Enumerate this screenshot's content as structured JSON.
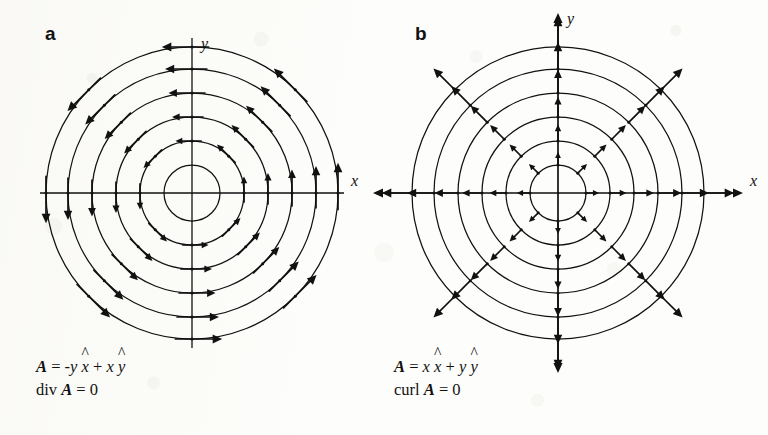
{
  "figure": {
    "background_color": "#fdfdfb",
    "ink_color": "#111111",
    "title": ""
  },
  "panels": [
    {
      "id": "a",
      "label": "a",
      "axis_x_label": "x",
      "axis_y_label": "y",
      "caption_line1_prefix": "A",
      "caption_line1": "A = -y x̂ + x ŷ",
      "caption_line2": "div A = 0",
      "caption_parts": {
        "vector_symbol": "A",
        "equals": "=",
        "term1_sign": "-",
        "term1_scalar": "y",
        "term1_unit": "x",
        "plus": "+",
        "term2_scalar": "x",
        "term2_unit": "y",
        "operator": "div",
        "operator_value": "0"
      },
      "field_type": "circulation",
      "center": {
        "x": 192,
        "y": 193
      },
      "circle_radii": [
        28,
        52,
        76,
        100,
        124,
        146
      ],
      "arrow_radii": [
        52,
        76,
        100,
        124,
        146
      ],
      "arrow_angles_deg": [
        0,
        45,
        90,
        135,
        180,
        225,
        270,
        315
      ],
      "axis_half_length_x": 152,
      "axis_half_length_y": 155,
      "axis_arrowheads": false
    },
    {
      "id": "b",
      "label": "b",
      "axis_x_label": "x",
      "axis_y_label": "y",
      "caption_line1": "A = x x̂ + y ŷ",
      "caption_line2": "curl A = 0",
      "caption_parts": {
        "vector_symbol": "A",
        "equals": "=",
        "term1_sign": "",
        "term1_scalar": "x",
        "term1_unit": "x",
        "plus": "+",
        "term2_scalar": "y",
        "term2_unit": "y",
        "operator": "curl",
        "operator_value": "0"
      },
      "field_type": "radial",
      "center": {
        "x": 174,
        "y": 193
      },
      "circle_radii": [
        28,
        52,
        76,
        100,
        124,
        146
      ],
      "arrow_radii": [
        28,
        52,
        76,
        100,
        124,
        146
      ],
      "arrow_angles_deg": [
        0,
        45,
        90,
        135,
        180,
        225,
        270,
        315
      ],
      "axis_half_length_x": 185,
      "axis_half_length_y": 180,
      "axis_arrowheads": true
    }
  ],
  "chart_data": {
    "type": "scatter",
    "xlabel": "x",
    "ylabel": "y",
    "grid": false,
    "legend": "none",
    "panels": [
      {
        "label": "a",
        "description": "Concentric circular field lines with counter-clockwise tangential arrows",
        "formula": "A = -y x̂ + x ŷ",
        "property": "div A = 0",
        "contour_radii": [
          1,
          2,
          3,
          4,
          5,
          6
        ],
        "arrow_direction": "counter-clockwise tangential",
        "arrow_angles_deg": [
          0,
          45,
          90,
          135,
          180,
          225,
          270,
          315
        ],
        "arrow_magnitude_rule": "proportional to radius"
      },
      {
        "label": "b",
        "description": "Concentric circles with outward radial arrows",
        "formula": "A = x x̂ + y ŷ",
        "property": "curl A = 0",
        "contour_radii": [
          1,
          2,
          3,
          4,
          5,
          6
        ],
        "arrow_direction": "outward radial",
        "arrow_angles_deg": [
          0,
          45,
          90,
          135,
          180,
          225,
          270,
          315
        ],
        "arrow_magnitude_rule": "proportional to radius"
      }
    ]
  }
}
